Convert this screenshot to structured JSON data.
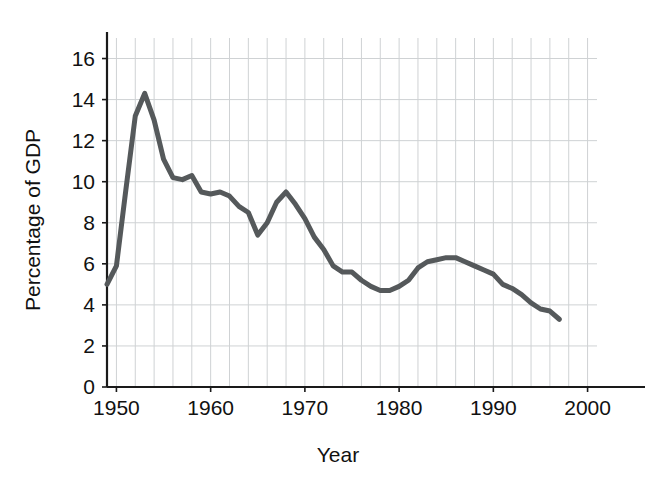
{
  "chart_data": {
    "type": "line",
    "title": "",
    "subtitle": "",
    "xlabel": "Year",
    "ylabel": "Percentage of GDP",
    "xlim": [
      1949,
      2001
    ],
    "ylim": [
      0,
      17
    ],
    "grid": true,
    "legend": false,
    "legend_position": "none",
    "line_color": "#55595b",
    "line_width": 5,
    "axis_color": "#1a1a1a",
    "grid_color": "#cfd2d4",
    "background_color": "#ffffff",
    "x_ticks": [
      1950,
      1960,
      1970,
      1980,
      1990,
      2000
    ],
    "x_tick_labels": [
      "1950",
      "1960",
      "1970",
      "1980",
      "1990",
      "2000"
    ],
    "x_minor_tick_step": 2,
    "y_ticks": [
      0,
      2,
      4,
      6,
      8,
      10,
      12,
      14,
      16
    ],
    "y_tick_labels": [
      "0",
      "2",
      "4",
      "6",
      "8",
      "10",
      "12",
      "14",
      "16"
    ],
    "series": [
      {
        "name": "Percentage of GDP",
        "color": "#55595b",
        "x": [
          1949,
          1950,
          1951,
          1952,
          1953,
          1954,
          1955,
          1956,
          1957,
          1958,
          1959,
          1960,
          1961,
          1962,
          1963,
          1964,
          1965,
          1966,
          1967,
          1968,
          1969,
          1970,
          1971,
          1972,
          1973,
          1974,
          1975,
          1976,
          1977,
          1978,
          1979,
          1980,
          1981,
          1982,
          1983,
          1984,
          1985,
          1986,
          1987,
          1988,
          1989,
          1990,
          1991,
          1992,
          1993,
          1994,
          1995,
          1996,
          1997
        ],
        "y": [
          5.0,
          5.9,
          9.6,
          13.2,
          14.3,
          13.0,
          11.1,
          10.2,
          10.1,
          10.3,
          9.5,
          9.4,
          9.5,
          9.3,
          8.8,
          8.5,
          7.4,
          8.0,
          9.0,
          9.5,
          8.9,
          8.2,
          7.3,
          6.7,
          5.9,
          5.6,
          5.6,
          5.2,
          4.9,
          4.7,
          4.7,
          4.9,
          5.2,
          5.8,
          6.1,
          6.2,
          6.3,
          6.3,
          6.1,
          5.9,
          5.7,
          5.5,
          5.0,
          4.8,
          4.5,
          4.1,
          3.8,
          3.7,
          3.3
        ]
      }
    ]
  },
  "axis_labels": {
    "x_title": "Year",
    "y_title": "Percentage of GDP"
  }
}
